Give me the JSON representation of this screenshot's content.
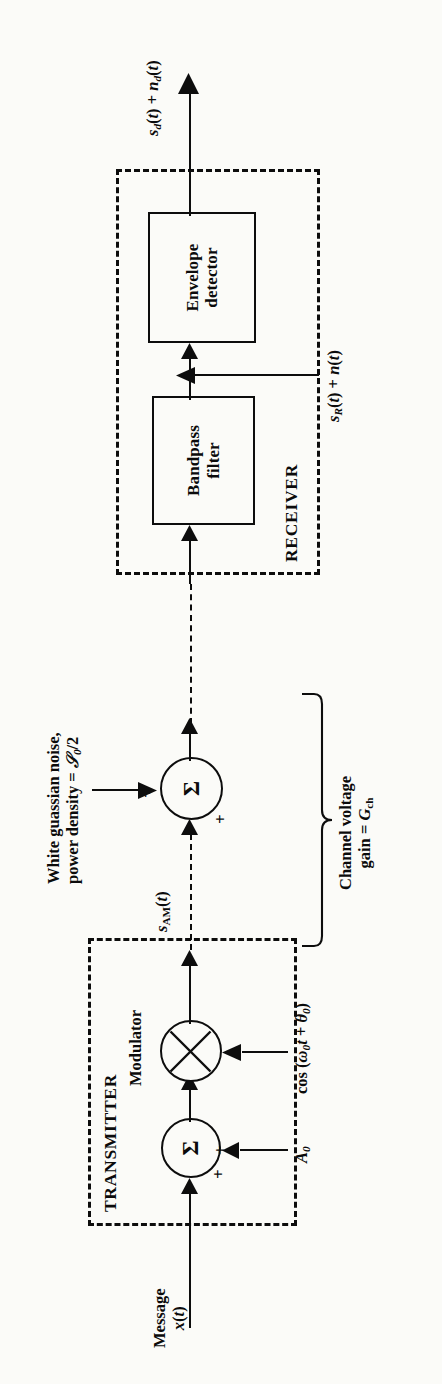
{
  "diagram": {
    "orientation": "rotated-90-ccw",
    "type": "block-diagram",
    "background_color": "#fbfbf8",
    "line_color": "#0d0d0d"
  },
  "sections": {
    "transmitter": {
      "label": "TRANSMITTER",
      "style": "dashed-box"
    },
    "receiver": {
      "label": "RECEIVER",
      "style": "dashed-box"
    },
    "channel": {
      "brace_label_line1": "Channel voltage",
      "brace_label_line2": "gain = G",
      "brace_label_sub": "ch"
    }
  },
  "blocks": [
    {
      "name": "bandpass-filter",
      "line1": "Bandpass",
      "line2": "filter"
    },
    {
      "name": "envelope-detector",
      "line1": "Envelope",
      "line2": "detector"
    }
  ],
  "nodes": [
    {
      "name": "transmitter-summer",
      "glyph": "Σ",
      "inputs": [
        "+",
        "+"
      ]
    },
    {
      "name": "modulator-multiplier",
      "glyph": "⊗"
    },
    {
      "name": "channel-summer",
      "glyph": "Σ",
      "inputs": [
        "+",
        "+"
      ]
    }
  ],
  "labels": {
    "message_line1": "Message",
    "message_line2": "x(t)",
    "modulator": "Modulator",
    "carrier_amplitude": "A0",
    "carrier": "cos (ω0t + θ0)",
    "s_am": "sAM(t)",
    "noise_line1": "White guassian noise,",
    "noise_line2": "power density = 𝒩0/2",
    "received_signal": "sR(t) + n(t)",
    "output_signal": "sd(t) + nd(t)",
    "channel_gain_line1": "Channel voltage",
    "channel_gain_line2": "gain = Gch"
  },
  "signal_flow": [
    "Message x(t) -> Transmitter summer (+)",
    "A0 -> Transmitter summer (+)",
    "Transmitter summer -> Modulator multiplier",
    "cos (w0 t + theta0) -> Modulator multiplier",
    "Modulator multiplier -> sAM(t) (channel, dashed)",
    "sAM(t) -> Channel summer (+)",
    "White guassian noise, power density N0/2 -> Channel summer (+)",
    "Channel summer -> Receiver (dashed channel line)",
    "-> Bandpass filter",
    "sR(t) + n(t) enters at Bandpass filter output node",
    "Bandpass filter -> Envelope detector",
    "Envelope detector -> sd(t) + nd(t)"
  ]
}
